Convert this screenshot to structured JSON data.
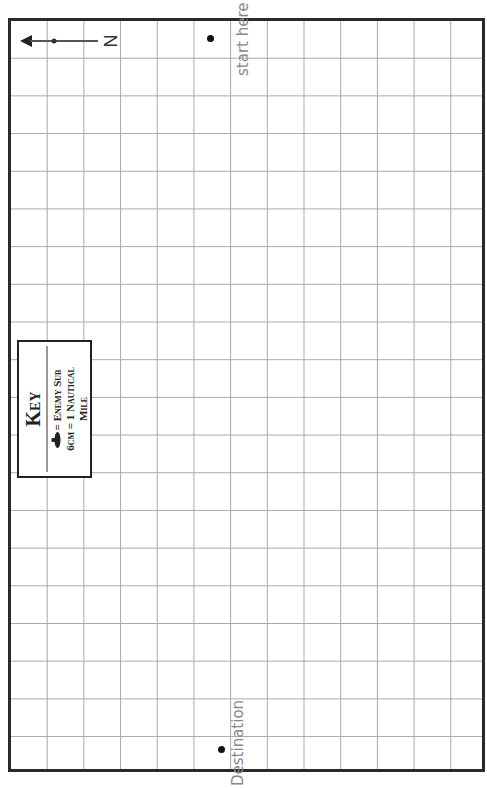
{
  "map": {
    "grid": {
      "columns": 13,
      "rows": 20,
      "line_color": "#a9a9a9",
      "border_color": "#2a2a2a"
    },
    "compass": {
      "label": "N",
      "direction": "left"
    },
    "start": {
      "label": "start here"
    },
    "destination": {
      "label": "Destination"
    },
    "key": {
      "title": "Key",
      "line1_text": "= Enemy Sub",
      "line1_icon": "submarine-icon",
      "line2": "6cm = 1 Nautical",
      "line3": "Mile"
    }
  }
}
